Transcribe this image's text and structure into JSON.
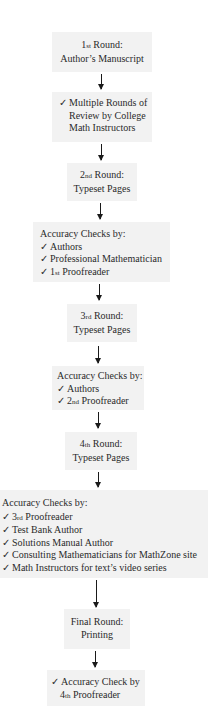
{
  "diagram": {
    "type": "flowchart",
    "direction": "top-to-bottom",
    "colors": {
      "box_fill": "#f2f2f2",
      "text": "#2a2a2a",
      "arrow": "#1a1a1a",
      "background": "#ffffff"
    },
    "check_glyph": "✓",
    "nodes": [
      {
        "id": "n1",
        "lines": [
          {
            "ord_num": "1",
            "ord_suffix": "st",
            "text": " Round:"
          },
          {
            "text": "Author’s Manuscript"
          }
        ]
      },
      {
        "id": "n2",
        "lines": [
          {
            "check": true,
            "text": "Multiple Rounds of"
          },
          {
            "text": "Review by College"
          },
          {
            "text": "Math Instructors"
          }
        ]
      },
      {
        "id": "n3",
        "lines": [
          {
            "ord_num": "2",
            "ord_suffix": "nd",
            "text": " Round:"
          },
          {
            "text": "Typeset Pages"
          }
        ]
      },
      {
        "id": "n4",
        "heading": "Accuracy Checks by:",
        "items": [
          {
            "text": "Authors"
          },
          {
            "text": "Professional Mathematician"
          },
          {
            "ord_num": "1",
            "ord_suffix": "st",
            "text": " Proofreader"
          }
        ]
      },
      {
        "id": "n5",
        "lines": [
          {
            "ord_num": "3",
            "ord_suffix": "rd",
            "text": " Round:"
          },
          {
            "text": "Typeset Pages"
          }
        ]
      },
      {
        "id": "n6",
        "heading": "Accuracy Checks by:",
        "items": [
          {
            "text": "Authors"
          },
          {
            "ord_num": "2",
            "ord_suffix": "nd",
            "text": " Proofreader"
          }
        ]
      },
      {
        "id": "n7",
        "lines": [
          {
            "ord_num": "4",
            "ord_suffix": "th",
            "text": " Round:"
          },
          {
            "text": "Typeset Pages"
          }
        ]
      },
      {
        "id": "n8",
        "heading": "Accuracy Checks by:",
        "items": [
          {
            "ord_num": "3",
            "ord_suffix": "rd",
            "text": " Proofreader"
          },
          {
            "text": "Test Bank Author"
          },
          {
            "text": "Solutions Manual Author"
          },
          {
            "text": "Consulting Mathematicians for MathZone site"
          },
          {
            "text": "Math Instructors for text’s video series"
          }
        ]
      },
      {
        "id": "n9",
        "lines": [
          {
            "text": "Final Round:"
          },
          {
            "text": "Printing"
          }
        ]
      },
      {
        "id": "n10",
        "lines": [
          {
            "check": true,
            "text": "Accuracy Check by"
          },
          {
            "ord_num": "4",
            "ord_suffix": "th",
            "text": " Proofreader"
          }
        ]
      }
    ],
    "edges": [
      {
        "from": "n1",
        "to": "n2"
      },
      {
        "from": "n2",
        "to": "n3"
      },
      {
        "from": "n3",
        "to": "n4"
      },
      {
        "from": "n4",
        "to": "n5"
      },
      {
        "from": "n5",
        "to": "n6"
      },
      {
        "from": "n6",
        "to": "n7"
      },
      {
        "from": "n7",
        "to": "n8"
      },
      {
        "from": "n8",
        "to": "n9"
      },
      {
        "from": "n9",
        "to": "n10"
      }
    ]
  }
}
